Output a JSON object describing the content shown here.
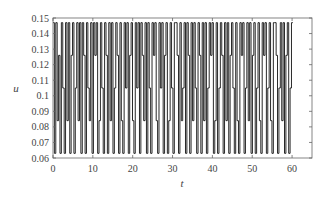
{
  "chart_data": {
    "type": "line",
    "title": "",
    "xlabel": "t",
    "ylabel": "u",
    "xlim": [
      0,
      65
    ],
    "ylim": [
      0.06,
      0.15
    ],
    "grid": false,
    "legend": null,
    "xticks": [
      0,
      10,
      20,
      30,
      40,
      50,
      60
    ],
    "xtick_labels": [
      "0",
      "10",
      "20",
      "30",
      "40",
      "50",
      "60"
    ],
    "yticks": [
      0.06,
      0.07,
      0.08,
      0.09,
      0.1,
      0.11,
      0.12,
      0.13,
      0.14,
      0.15
    ],
    "ytick_labels": [
      "0.06",
      "0.07",
      "0.08",
      "0.09",
      "0.1",
      "0.11",
      "0.12",
      "0.13",
      "0.14",
      "0.15"
    ],
    "levels": [
      0.063,
      0.084,
      0.105,
      0.126,
      0.147
    ],
    "t_end": 62,
    "series": [
      {
        "name": "u",
        "color": "#111111",
        "step": 0.35,
        "level_index_sequence": [
          4,
          0,
          4,
          1,
          3,
          0,
          4,
          2,
          0,
          4,
          1,
          4,
          0,
          3,
          4,
          0,
          2,
          4,
          1,
          4,
          0,
          4,
          3,
          0,
          4,
          2,
          1,
          4,
          0,
          4,
          3,
          4,
          0,
          1,
          4,
          2,
          0,
          4,
          3,
          0,
          4,
          1,
          4,
          0,
          2,
          4,
          3,
          0,
          4,
          1,
          0,
          4,
          2,
          4,
          0,
          3,
          4,
          1,
          0,
          4,
          2,
          4,
          0,
          4,
          3,
          1,
          4,
          0,
          4,
          2,
          0,
          4,
          3,
          4,
          1,
          0,
          4,
          2,
          4,
          0,
          3,
          4,
          0,
          1,
          4,
          2,
          0,
          4,
          4,
          3,
          0,
          4,
          1,
          2,
          4,
          0,
          4,
          3,
          0,
          4,
          1,
          4,
          2,
          0,
          4,
          3,
          0,
          4,
          1,
          4,
          0,
          2,
          4,
          3,
          4,
          0,
          1,
          4,
          0,
          2,
          4,
          3,
          0,
          4,
          1,
          4,
          0,
          3,
          4,
          2,
          0,
          4,
          1,
          0,
          4,
          3,
          4,
          0,
          2,
          4,
          1,
          4,
          0,
          3,
          4,
          0,
          2,
          4,
          1,
          0,
          4,
          3,
          4,
          0,
          2,
          4,
          1,
          0,
          4,
          4,
          3,
          0,
          2,
          4,
          1,
          4,
          0,
          3,
          4,
          0,
          2,
          4
        ]
      }
    ]
  }
}
